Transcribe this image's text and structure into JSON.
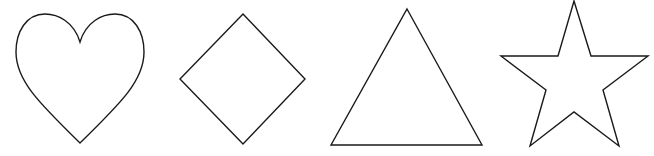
{
  "canvas": {
    "width": 654,
    "height": 156,
    "background": "#ffffff"
  },
  "style": {
    "stroke": "#1a1a1a",
    "fill": "#ffffff"
  },
  "shapes": [
    {
      "name": "heart",
      "path": "M80,42 C74,22 58,14 45,14 C26,14 16,32 16,52 C16,80 38,102 80,143 C122,102 144,80 144,52 C144,32 134,14 115,14 C102,14 86,22 80,42 Z"
    },
    {
      "name": "diamond",
      "points": "243,14 305,79 243,144 180,79"
    },
    {
      "name": "triangle",
      "points": "407,9 482,145 331,145"
    },
    {
      "name": "star",
      "points": "574,1 591,56 648,56 603,90 619,146 574,112 530,146 546,90 501,56 558,56"
    }
  ]
}
